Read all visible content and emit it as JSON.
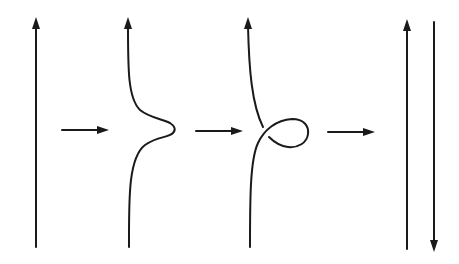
{
  "diagram": {
    "colors": {
      "stroke": "#1a1a1a",
      "background": "#ffffff"
    },
    "panels": [
      {
        "id": "straight-strand",
        "orientation": "up"
      },
      {
        "id": "bumped-strand",
        "orientation": "up"
      },
      {
        "id": "looped-strand",
        "orientation": "up"
      },
      {
        "id": "antiparallel-pair",
        "orientation": [
          "up",
          "down"
        ]
      }
    ],
    "transitions": [
      {
        "from": "straight-strand",
        "to": "bumped-strand"
      },
      {
        "from": "bumped-strand",
        "to": "looped-strand"
      },
      {
        "from": "looped-strand",
        "to": "antiparallel-pair"
      }
    ]
  }
}
